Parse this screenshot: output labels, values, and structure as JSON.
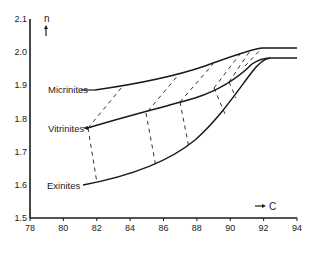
{
  "chart_data": {
    "type": "line",
    "title": "",
    "xlabel": "C",
    "ylabel": "n",
    "xlim": [
      78,
      94
    ],
    "ylim": [
      1.5,
      2.1
    ],
    "x_ticks": [
      "78",
      "80",
      "82",
      "84",
      "86",
      "88",
      "90",
      "92",
      "94"
    ],
    "y_ticks": [
      "1.5",
      "1.6",
      "1.7",
      "1.8",
      "1.9",
      "2.0",
      "2.1"
    ],
    "grid": false,
    "series": [
      {
        "name": "Micrinites",
        "x": [
          81.8,
          83.5,
          86,
          88.5,
          90.5,
          92.3,
          94
        ],
        "y": [
          1.89,
          1.9,
          1.935,
          1.975,
          2.01,
          2.02,
          2.02
        ]
      },
      {
        "name": "Vitrinites",
        "x": [
          81.5,
          85,
          87.5,
          89.5,
          90.8,
          91.8,
          92.3,
          94
        ],
        "y": [
          1.78,
          1.835,
          1.875,
          1.92,
          1.955,
          1.985,
          1.99,
          1.99
        ]
      },
      {
        "name": "Exinites",
        "x": [
          82,
          84.5,
          87,
          88.5,
          89.8,
          90.8,
          91.6,
          92.3
        ],
        "y": [
          1.62,
          1.655,
          1.715,
          1.78,
          1.86,
          1.935,
          1.98,
          1.99
        ]
      }
    ],
    "tie_lines": "dashed lines connecting equal-rank points between curves",
    "annotations": [
      "n ↑",
      "→ C"
    ]
  },
  "labels": {
    "micrinites": "Micrinites",
    "vitrinites": "Vitrinites",
    "exinites": "Exinites",
    "y_axis": "n",
    "x_axis": "C"
  },
  "colors": {
    "ink": "#1a1a1a",
    "background": "#ffffff"
  }
}
